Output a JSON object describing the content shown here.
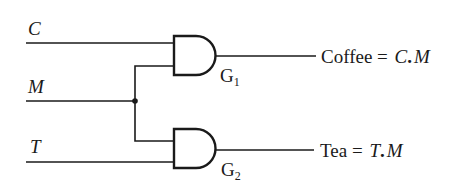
{
  "diagram": {
    "inputs": [
      {
        "name": "C"
      },
      {
        "name": "M"
      },
      {
        "name": "T"
      }
    ],
    "gates": [
      {
        "id": "G",
        "sub": "1",
        "type": "AND"
      },
      {
        "id": "G",
        "sub": "2",
        "type": "AND"
      }
    ],
    "outputs": [
      {
        "name": "Coffee",
        "eq": " = ",
        "expr_a": "C",
        "dot": ".",
        "expr_b": "M"
      },
      {
        "name": "Tea",
        "eq": " = ",
        "expr_a": "T",
        "dot": ".",
        "expr_b": "M"
      }
    ],
    "colors": {
      "ink": "#1a1a1a",
      "background": "#ffffff"
    }
  }
}
